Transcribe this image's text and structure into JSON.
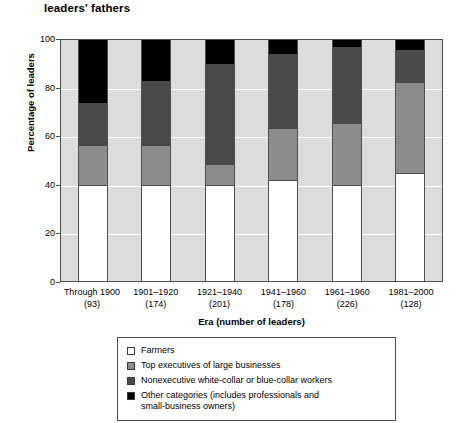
{
  "chart_data": {
    "type": "bar",
    "subtype": "stacked-percentage",
    "title": "leaders' fathers",
    "xlabel": "Era (number of leaders)",
    "ylabel": "Percentage of leaders",
    "ylim": [
      0,
      100
    ],
    "yticks": [
      0,
      20,
      40,
      60,
      80,
      100
    ],
    "grid": "horizontal-white",
    "legend_position": "below-plot",
    "categories": [
      "Through 1900\n(93)",
      "1901–1920\n(174)",
      "1921–1940\n(201)",
      "1941–1960\n(178)",
      "1961–1960\n(226)",
      "1981–2000\n(128)"
    ],
    "category_eras": [
      "Through 1900",
      "1901–1920",
      "1921–1940",
      "1941–1960",
      "1961–1960",
      "1981–2000"
    ],
    "category_counts": [
      "(93)",
      "(174)",
      "(201)",
      "(178)",
      "(226)",
      "(128)"
    ],
    "series": [
      {
        "name": "Other categories (includes professionals and small-business owners)",
        "color": "#000000",
        "values": [
          40,
          40,
          40,
          42,
          40,
          45
        ]
      },
      {
        "name": "Nonexecutive white-collar or blue-collar workers",
        "color": "#4a4a4a",
        "values": [
          16,
          16,
          8,
          21,
          25,
          37
        ]
      },
      {
        "name": "Top executives of large businesses",
        "color": "#8c8c8c",
        "values": [
          18,
          27,
          42,
          31,
          32,
          14
        ]
      },
      {
        "name": "Farmers",
        "color": "#ffffff",
        "values": [
          26,
          17,
          10,
          6,
          3,
          4
        ]
      }
    ]
  },
  "legend": {
    "items": [
      {
        "label": "Farmers",
        "swatch": "white-swatch"
      },
      {
        "label": "Top executives of large businesses",
        "swatch": "light-gray-swatch"
      },
      {
        "label": "Nonexecutive white-collar or blue-collar workers",
        "swatch": "dark-gray-swatch"
      },
      {
        "label": "Other categories (includes professionals and",
        "label_line2": "small-business owners)",
        "swatch": "black-swatch"
      }
    ]
  }
}
